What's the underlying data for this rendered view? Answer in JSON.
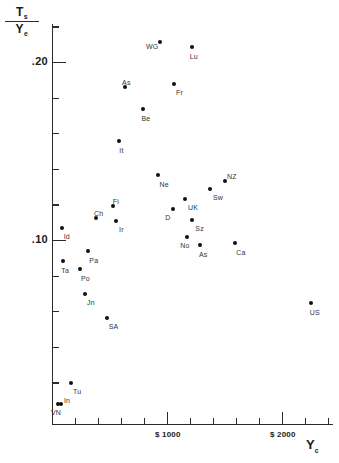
{
  "chart_data": {
    "type": "scatter",
    "title": "",
    "xlabel": "Y_c",
    "ylabel": "T_s / Y_e",
    "ylabel_numerator": "T",
    "ylabel_numerator_sub": "s",
    "ylabel_denominator": "Y",
    "ylabel_denominator_sub": "e",
    "xlabel_main": "Y",
    "xlabel_sub": "c",
    "xlim": [
      0,
      2500
    ],
    "ylim": [
      0.0,
      0.23
    ],
    "grid": false,
    "legend": null,
    "yticks": [
      {
        "value": 0.2,
        "label": ".20",
        "major": true
      },
      {
        "value": 0.18,
        "label": "",
        "major": false
      },
      {
        "value": 0.16,
        "label": "",
        "major": false
      },
      {
        "value": 0.14,
        "label": "",
        "major": false
      },
      {
        "value": 0.12,
        "label": "",
        "major": false
      },
      {
        "value": 0.1,
        "label": ".10",
        "major": true
      },
      {
        "value": 0.08,
        "label": "",
        "major": false
      },
      {
        "value": 0.06,
        "label": "",
        "major": false
      },
      {
        "value": 0.04,
        "label": "",
        "major": false
      },
      {
        "value": 0.02,
        "label": "",
        "major": false
      },
      {
        "value": 0.22,
        "label": "",
        "major": false
      }
    ],
    "xticks": [
      {
        "value": 200,
        "label": "",
        "major": false
      },
      {
        "value": 400,
        "label": "",
        "major": false
      },
      {
        "value": 600,
        "label": "",
        "major": false
      },
      {
        "value": 800,
        "label": "",
        "major": false
      },
      {
        "value": 1000,
        "label": "$ 1000",
        "major": true
      },
      {
        "value": 1200,
        "label": "",
        "major": false
      },
      {
        "value": 1400,
        "label": "",
        "major": false
      },
      {
        "value": 1600,
        "label": "",
        "major": false
      },
      {
        "value": 1800,
        "label": "",
        "major": false
      },
      {
        "value": 2000,
        "label": "$ 2000",
        "major": true
      },
      {
        "value": 2200,
        "label": "",
        "major": false
      },
      {
        "value": 2400,
        "label": "",
        "major": false
      }
    ],
    "points": [
      {
        "label": "WG",
        "x": 939,
        "y": 0.2115,
        "lx": -14,
        "ly": 1
      },
      {
        "label": "Lu",
        "x": 1215,
        "y": 0.2085,
        "lx": -2,
        "ly": 6
      },
      {
        "label": "As",
        "x": 635,
        "y": 0.1862,
        "lx": -3,
        "ly": -8
      },
      {
        "label": "Fr",
        "x": 1061,
        "y": 0.1877,
        "lx": 2,
        "ly": 5
      },
      {
        "label": "Be",
        "x": 787,
        "y": 0.1736,
        "lx": -1,
        "ly": 6
      },
      {
        "label": "It",
        "x": 585,
        "y": 0.1558,
        "lx": 0,
        "ly": 6
      },
      {
        "label": "Ne",
        "x": 925,
        "y": 0.1365,
        "lx": 1,
        "ly": 6
      },
      {
        "label": "NZ",
        "x": 1504,
        "y": 0.1334,
        "lx": 2,
        "ly": -8
      },
      {
        "label": "Sw",
        "x": 1374,
        "y": 0.1286,
        "lx": 3,
        "ly": 5
      },
      {
        "label": "UK",
        "x": 1157,
        "y": 0.1228,
        "lx": 3,
        "ly": 5
      },
      {
        "label": "D",
        "x": 1055,
        "y": 0.1172,
        "lx": -8,
        "ly": 5
      },
      {
        "label": "Sz",
        "x": 1220,
        "y": 0.1112,
        "lx": 3,
        "ly": 5
      },
      {
        "label": "Fi",
        "x": 528,
        "y": 0.1191,
        "lx": 0,
        "ly": -8
      },
      {
        "label": "Ch",
        "x": 383,
        "y": 0.1122,
        "lx": -2,
        "ly": -8
      },
      {
        "label": "Ir",
        "x": 557,
        "y": 0.1107,
        "lx": 3,
        "ly": 5
      },
      {
        "label": "Id",
        "x": 84,
        "y": 0.1066,
        "lx": 2,
        "ly": 5
      },
      {
        "label": "No",
        "x": 1177,
        "y": 0.1015,
        "lx": -7,
        "ly": 5
      },
      {
        "label": "As2",
        "x": 1287,
        "y": 0.0972,
        "lx": -1,
        "ly": 6
      },
      {
        "label": "Ca",
        "x": 1594,
        "y": 0.0985,
        "lx": 1,
        "ly": 6
      },
      {
        "label": "Pa",
        "x": 316,
        "y": 0.0939,
        "lx": 1,
        "ly": 6
      },
      {
        "label": "Ta",
        "x": 98,
        "y": 0.0883,
        "lx": -2,
        "ly": 6
      },
      {
        "label": "Po",
        "x": 243,
        "y": 0.0836,
        "lx": 1,
        "ly": 6
      },
      {
        "label": "Jn",
        "x": 287,
        "y": 0.0694,
        "lx": 2,
        "ly": 5
      },
      {
        "label": "SA",
        "x": 476,
        "y": 0.056,
        "lx": 2,
        "ly": 5
      },
      {
        "label": "US",
        "x": 2250,
        "y": 0.0644,
        "lx": -1,
        "ly": 6
      },
      {
        "label": "Tu",
        "x": 165,
        "y": 0.0194,
        "lx": 2,
        "ly": 5
      },
      {
        "label": "In",
        "x": 78,
        "y": 0.0076,
        "lx": 3,
        "ly": -7
      },
      {
        "label": "VN",
        "x": 52,
        "y": 0.0076,
        "lx": -7,
        "ly": 5
      }
    ],
    "point_display_labels": {
      "As2": "As"
    }
  }
}
